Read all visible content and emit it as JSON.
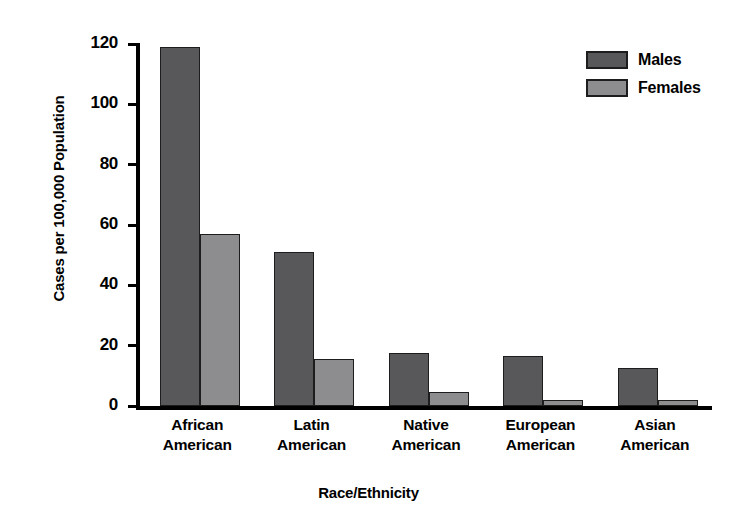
{
  "chart_data": {
    "type": "bar",
    "title": "",
    "subtitle": "",
    "xlabel": "Race/Ethnicity",
    "ylabel": "Cases per 100,000 Population",
    "categories": [
      "African American",
      "Latin American",
      "Native American",
      "European American",
      "Asian American"
    ],
    "category_lines": [
      [
        "African",
        "American"
      ],
      [
        "Latin",
        "American"
      ],
      [
        "Native",
        "American"
      ],
      [
        "European",
        "American"
      ],
      [
        "Asian",
        "American"
      ]
    ],
    "series": [
      {
        "name": "Males",
        "color": "#58585a",
        "values": [
          119,
          51,
          17.5,
          16.5,
          12.5
        ]
      },
      {
        "name": "Females",
        "color": "#8d8d8f",
        "values": [
          57,
          15.5,
          4.5,
          2,
          2
        ]
      }
    ],
    "ylim": [
      0,
      120
    ],
    "yticks": [
      0,
      20,
      40,
      60,
      80,
      100,
      120
    ],
    "ytick_labels": [
      "0",
      "20",
      "40",
      "60",
      "80",
      "100",
      "120"
    ],
    "grid": false,
    "legend_position": "top-right",
    "legend_entries": [
      "Males",
      "Females"
    ]
  },
  "colors": {
    "males": "#58585a",
    "females": "#8d8d8f",
    "axis": "#000000",
    "background": "#ffffff"
  }
}
